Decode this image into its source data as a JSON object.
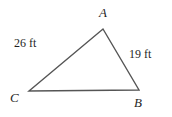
{
  "figure": {
    "type": "triangle-diagram",
    "background_color": "#ffffff",
    "stroke_color": "#555555",
    "text_color": "#1f1f1f",
    "width": 172,
    "height": 117,
    "vertices": [
      {
        "name": "A",
        "label": "A",
        "x": 103,
        "y": 29
      },
      {
        "name": "B",
        "label": "B",
        "x": 139,
        "y": 90
      },
      {
        "name": "C",
        "label": "C",
        "x": 29,
        "y": 91
      }
    ],
    "sides": [
      {
        "name": "CA",
        "from": "C",
        "to": "A",
        "label": "26 ft",
        "length": 26,
        "unit": "ft"
      },
      {
        "name": "AB",
        "from": "A",
        "to": "B",
        "label": "19 ft",
        "length": 19,
        "unit": "ft"
      },
      {
        "name": "CB",
        "from": "C",
        "to": "B",
        "label": "",
        "length": null,
        "unit": "ft"
      }
    ]
  }
}
